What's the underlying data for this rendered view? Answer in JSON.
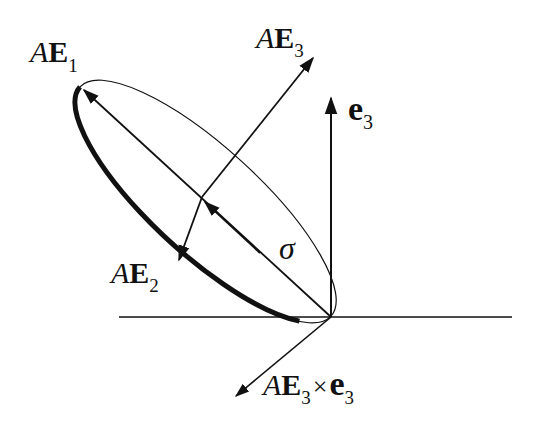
{
  "diagram": {
    "type": "geometric vector diagram",
    "labels": {
      "ae1": {
        "prefix": "A",
        "vector": "E",
        "sub": "1"
      },
      "ae2": {
        "prefix": "A",
        "vector": "E",
        "sub": "2"
      },
      "ae3": {
        "prefix": "A",
        "vector": "E",
        "sub": "3"
      },
      "e3": {
        "vector": "e",
        "sub": "3"
      },
      "sigma": "σ",
      "cross": {
        "prefix": "A",
        "vector": "E",
        "sub": "3",
        "op": "×",
        "vector2": "e",
        "sub2": "3"
      }
    },
    "colors": {
      "ink": "#111111",
      "background": "#ffffff"
    }
  }
}
